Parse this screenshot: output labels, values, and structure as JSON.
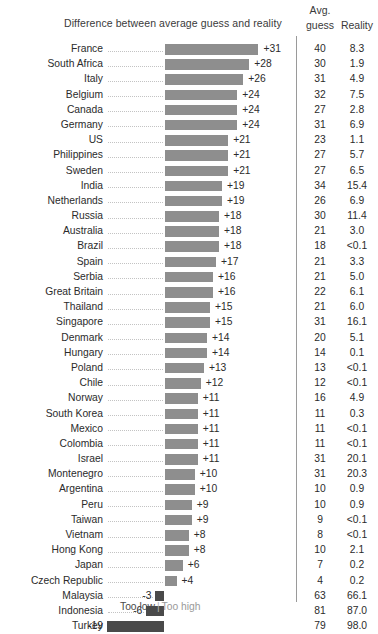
{
  "header": {
    "bar_column_title": "Difference between average guess and reality",
    "avg_line1": "Avg.",
    "avg_line2": "guess",
    "reality": "Reality"
  },
  "legend": {
    "too_low": "Too low",
    "separator": "|",
    "too_high": "Too high"
  },
  "colors": {
    "bar_positive": "#8e8e8e",
    "bar_negative": "#4a4a4a",
    "text": "#2b2b2b",
    "leader": "#c3c3c3",
    "divider": "#9a9a9a"
  },
  "chart_data": {
    "type": "bar",
    "title": "Difference between average guess and reality",
    "xlabel": "Difference between average guess and reality (percentage points)",
    "ylabel": "",
    "orientation": "horizontal",
    "grid": false,
    "zero_baseline": true,
    "legend_position": "bottom-center",
    "legend_entries": [
      "Too low",
      "Too high"
    ],
    "columns": [
      "Country",
      "Difference",
      "Avg. guess",
      "Reality"
    ],
    "categories": [
      "France",
      "South Africa",
      "Italy",
      "Belgium",
      "Canada",
      "Germany",
      "US",
      "Philippines",
      "Sweden",
      "India",
      "Netherlands",
      "Russia",
      "Australia",
      "Brazil",
      "Spain",
      "Serbia",
      "Great Britain",
      "Thailand",
      "Singapore",
      "Denmark",
      "Hungary",
      "Poland",
      "Chile",
      "Norway",
      "South Korea",
      "Mexico",
      "Colombia",
      "Israel",
      "Montenegro",
      "Argentina",
      "Peru",
      "Taiwan",
      "Vietnam",
      "Hong Kong",
      "Japan",
      "Czech Republic",
      "Malaysia",
      "Indonesia",
      "Turkey"
    ],
    "values": [
      31,
      28,
      26,
      24,
      24,
      24,
      21,
      21,
      21,
      19,
      19,
      18,
      18,
      18,
      17,
      16,
      16,
      15,
      15,
      14,
      14,
      13,
      12,
      11,
      11,
      11,
      11,
      11,
      10,
      10,
      9,
      9,
      8,
      8,
      6,
      4,
      -3,
      -6,
      -19
    ],
    "value_labels": [
      "+31",
      "+28",
      "+26",
      "+24",
      "+24",
      "+24",
      "+21",
      "+21",
      "+21",
      "+19",
      "+19",
      "+18",
      "+18",
      "+18",
      "+17",
      "+16",
      "+16",
      "+15",
      "+15",
      "+14",
      "+14",
      "+13",
      "+12",
      "+11",
      "+11",
      "+11",
      "+11",
      "+11",
      "+10",
      "+10",
      "+9",
      "+9",
      "+8",
      "+8",
      "+6",
      "+4",
      "-3",
      "-6",
      "-19"
    ],
    "series": [
      {
        "name": "Avg. guess",
        "values": [
          40,
          30,
          31,
          32,
          27,
          31,
          23,
          27,
          27,
          34,
          26,
          30,
          21,
          18,
          21,
          21,
          22,
          21,
          31,
          20,
          14,
          13,
          12,
          16,
          11,
          11,
          11,
          31,
          31,
          10,
          10,
          9,
          8,
          10,
          7,
          4,
          63,
          81,
          79
        ],
        "labels": [
          "40",
          "30",
          "31",
          "32",
          "27",
          "31",
          "23",
          "27",
          "27",
          "34",
          "26",
          "30",
          "21",
          "18",
          "21",
          "21",
          "22",
          "21",
          "31",
          "20",
          "14",
          "13",
          "12",
          "16",
          "11",
          "11",
          "11",
          "31",
          "31",
          "10",
          "10",
          "9",
          "8",
          "10",
          "7",
          "4",
          "63",
          "81",
          "79"
        ]
      },
      {
        "name": "Reality",
        "values": [
          8.3,
          1.9,
          4.9,
          7.5,
          2.8,
          6.9,
          1.1,
          5.7,
          6.5,
          15.4,
          6.9,
          11.4,
          3.0,
          0.05,
          3.3,
          5.0,
          6.1,
          6.0,
          16.1,
          5.1,
          0.1,
          0.05,
          0.05,
          4.9,
          0.3,
          0.05,
          0.05,
          20.1,
          20.3,
          0.9,
          0.9,
          0.05,
          0.05,
          2.1,
          0.2,
          0.2,
          66.1,
          87.0,
          98.0
        ],
        "labels": [
          "8.3",
          "1.9",
          "4.9",
          "7.5",
          "2.8",
          "6.9",
          "1.1",
          "5.7",
          "6.5",
          "15.4",
          "6.9",
          "11.4",
          "3.0",
          "<0.1",
          "3.3",
          "5.0",
          "6.1",
          "6.0",
          "16.1",
          "5.1",
          "0.1",
          "<0.1",
          "<0.1",
          "4.9",
          "0.3",
          "<0.1",
          "<0.1",
          "20.1",
          "20.3",
          "0.9",
          "0.9",
          "<0.1",
          "<0.1",
          "2.1",
          "0.2",
          "0.2",
          "66.1",
          "87.0",
          "98.0"
        ]
      }
    ]
  }
}
